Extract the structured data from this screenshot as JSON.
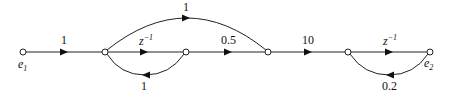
{
  "diagram": {
    "type": "signal-flow-graph",
    "nodes": [
      {
        "id": "e1",
        "label": "e",
        "subscript": "1",
        "x": 23,
        "y": 52
      },
      {
        "id": "n1",
        "label": "",
        "x": 105,
        "y": 52
      },
      {
        "id": "n2",
        "label": "",
        "x": 186,
        "y": 52
      },
      {
        "id": "n3",
        "label": "",
        "x": 268,
        "y": 52
      },
      {
        "id": "n4",
        "label": "",
        "x": 348,
        "y": 52
      },
      {
        "id": "e2",
        "label": "e",
        "subscript": "2",
        "x": 430,
        "y": 52
      }
    ],
    "edges": [
      {
        "from": "e1",
        "to": "n1",
        "gain": "1"
      },
      {
        "from": "n1",
        "to": "n2",
        "gain": "z",
        "gain_exp": "−1"
      },
      {
        "from": "n2",
        "to": "n1",
        "gain": "1",
        "shape": "lower-arc"
      },
      {
        "from": "n1",
        "to": "n3",
        "gain": "1",
        "shape": "upper-arc"
      },
      {
        "from": "n2",
        "to": "n3",
        "gain": "0.5"
      },
      {
        "from": "n3",
        "to": "n4",
        "gain": "10"
      },
      {
        "from": "n4",
        "to": "e2",
        "gain": "z",
        "gain_exp": "−1"
      },
      {
        "from": "e2",
        "to": "n4",
        "gain": "0.2",
        "shape": "lower-arc"
      }
    ]
  },
  "labels": {
    "e1_main": "e",
    "e1_sub": "1",
    "e2_main": "e",
    "e2_sub": "2",
    "g_e1_n1": "1",
    "g_top_arc": "1",
    "g_n1_n2_base": "z",
    "g_n1_n2_exp": "−1",
    "g_n2_n1": "1",
    "g_n2_n3": "0.5",
    "g_n3_n4": "10",
    "g_n4_e2_base": "z",
    "g_n4_e2_exp": "−1",
    "g_e2_n4": "0.2"
  }
}
